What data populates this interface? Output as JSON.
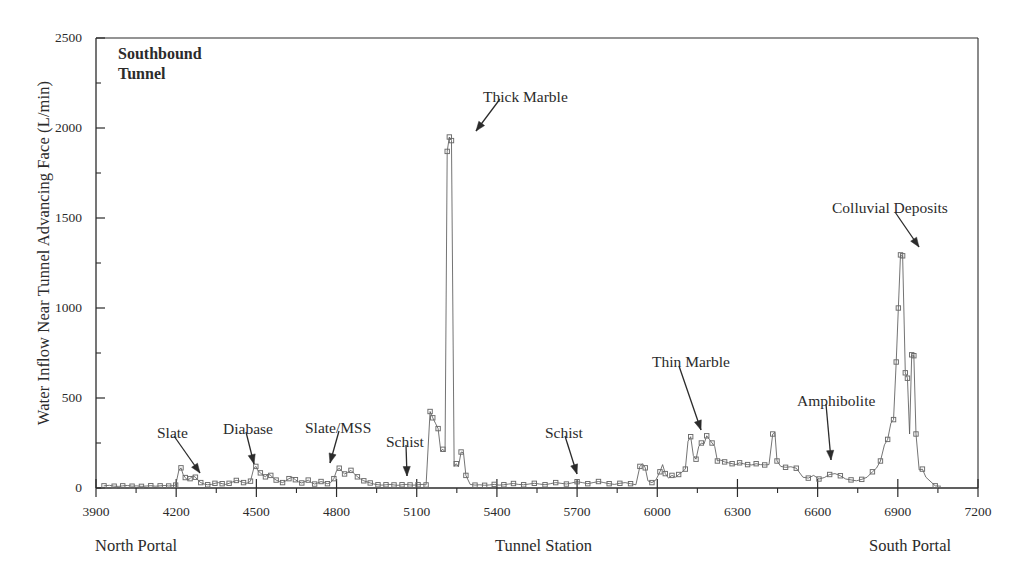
{
  "figure": {
    "panel_title": "Southbound\nTunnel",
    "panel_title_line1": "Southbound",
    "panel_title_line2": "Tunnel",
    "line_color": "#5b5b5b",
    "marker_color": "#6a6a6a",
    "axis_color": "#2b2b2b",
    "background": "#ffffff"
  },
  "axes": {
    "x_title": "Tunnel Station",
    "x_left_caption": "North Portal",
    "x_right_caption": "South Portal",
    "y_title": "Water Inflow Near Tunnel Advancing Face (L/min)",
    "x_ticks": [
      3900,
      4200,
      4500,
      4800,
      5100,
      5400,
      5700,
      6000,
      6300,
      6600,
      6900,
      7200
    ],
    "y_ticks": [
      0,
      500,
      1000,
      1500,
      2000,
      2500
    ],
    "y_minor_ticks": [
      250,
      750,
      1250,
      1750,
      2250
    ],
    "xlim": [
      3900,
      7200
    ],
    "ylim": [
      0,
      2500
    ]
  },
  "annotations": [
    {
      "label": "Slate",
      "text_x": 157,
      "text_y": 424,
      "tip_x": 200,
      "tip_y": 473,
      "tail_x": 174,
      "tail_y": 436
    },
    {
      "label": "Diabase",
      "text_x": 223,
      "text_y": 420,
      "tip_x": 254,
      "tip_y": 464,
      "tail_x": 246,
      "tail_y": 432
    },
    {
      "label": "Slate/MSS",
      "text_x": 305,
      "text_y": 419,
      "tip_x": 330,
      "tip_y": 463,
      "tail_x": 339,
      "tail_y": 431
    },
    {
      "label": "Schist",
      "text_x": 386,
      "text_y": 433,
      "tip_x": 407,
      "tip_y": 476,
      "tail_x": 406,
      "tail_y": 445
    },
    {
      "label": "Thick Marble",
      "text_x": 483,
      "text_y": 88,
      "tip_x": 476,
      "tip_y": 131,
      "tail_x": 500,
      "tail_y": 99
    },
    {
      "label": "Schist",
      "text_x": 545,
      "text_y": 424,
      "tip_x": 577,
      "tip_y": 474,
      "tail_x": 565,
      "tail_y": 436
    },
    {
      "label": "Thin Marble",
      "text_x": 652,
      "text_y": 353,
      "tip_x": 701,
      "tip_y": 430,
      "tail_x": 679,
      "tail_y": 366
    },
    {
      "label": "Amphibolite",
      "text_x": 797,
      "text_y": 392,
      "tip_x": 831,
      "tip_y": 460,
      "tail_x": 826,
      "tail_y": 404
    },
    {
      "label": "Colluvial Deposits",
      "text_x": 832,
      "text_y": 199,
      "tip_x": 919,
      "tip_y": 247,
      "tail_x": 895,
      "tail_y": 212
    }
  ],
  "chart_data": {
    "type": "line",
    "title": "Southbound Tunnel",
    "xlabel": "Tunnel Station",
    "ylabel": "Water Inflow Near Tunnel Advancing Face (L/min)",
    "xlim": [
      3900,
      7200
    ],
    "ylim": [
      0,
      2500
    ],
    "grid": false,
    "legend": "none",
    "marker": "open-square",
    "series": [
      {
        "name": "Water inflow near tunnel advancing face",
        "points": [
          [
            3930,
            12
          ],
          [
            3950,
            15
          ],
          [
            3968,
            10
          ],
          [
            3985,
            9
          ],
          [
            4000,
            12
          ],
          [
            4018,
            14
          ],
          [
            4035,
            10
          ],
          [
            4052,
            12
          ],
          [
            4070,
            9
          ],
          [
            4088,
            11
          ],
          [
            4105,
            13
          ],
          [
            4122,
            10
          ],
          [
            4140,
            12
          ],
          [
            4158,
            14
          ],
          [
            4172,
            11
          ],
          [
            4185,
            13
          ],
          [
            4198,
            16
          ],
          [
            4210,
            98
          ],
          [
            4218,
            112
          ],
          [
            4226,
            75
          ],
          [
            4234,
            58
          ],
          [
            4242,
            45
          ],
          [
            4252,
            52
          ],
          [
            4262,
            68
          ],
          [
            4272,
            60
          ],
          [
            4282,
            42
          ],
          [
            4292,
            30
          ],
          [
            4305,
            22
          ],
          [
            4318,
            18
          ],
          [
            4332,
            20
          ],
          [
            4345,
            26
          ],
          [
            4358,
            30
          ],
          [
            4372,
            24
          ],
          [
            4385,
            20
          ],
          [
            4398,
            26
          ],
          [
            4412,
            34
          ],
          [
            4425,
            42
          ],
          [
            4438,
            38
          ],
          [
            4452,
            30
          ],
          [
            4465,
            26
          ],
          [
            4478,
            38
          ],
          [
            4490,
            108
          ],
          [
            4498,
            120
          ],
          [
            4506,
            96
          ],
          [
            4515,
            84
          ],
          [
            4524,
            72
          ],
          [
            4534,
            62
          ],
          [
            4544,
            78
          ],
          [
            4554,
            70
          ],
          [
            4564,
            54
          ],
          [
            4574,
            44
          ],
          [
            4586,
            36
          ],
          [
            4598,
            30
          ],
          [
            4610,
            40
          ],
          [
            4622,
            52
          ],
          [
            4634,
            60
          ],
          [
            4646,
            46
          ],
          [
            4658,
            34
          ],
          [
            4670,
            28
          ],
          [
            4682,
            36
          ],
          [
            4694,
            44
          ],
          [
            4706,
            30
          ],
          [
            4718,
            22
          ],
          [
            4730,
            28
          ],
          [
            4742,
            36
          ],
          [
            4754,
            30
          ],
          [
            4766,
            24
          ],
          [
            4778,
            30
          ],
          [
            4790,
            52
          ],
          [
            4800,
            96
          ],
          [
            4810,
            110
          ],
          [
            4820,
            92
          ],
          [
            4830,
            78
          ],
          [
            4842,
            86
          ],
          [
            4854,
            98
          ],
          [
            4866,
            80
          ],
          [
            4878,
            62
          ],
          [
            4890,
            50
          ],
          [
            4902,
            40
          ],
          [
            4914,
            34
          ],
          [
            4926,
            28
          ],
          [
            4940,
            22
          ],
          [
            4955,
            18
          ],
          [
            4970,
            16
          ],
          [
            4985,
            18
          ],
          [
            5000,
            20
          ],
          [
            5015,
            17
          ],
          [
            5030,
            15
          ],
          [
            5045,
            18
          ],
          [
            5060,
            20
          ],
          [
            5075,
            17
          ],
          [
            5090,
            16
          ],
          [
            5105,
            18
          ],
          [
            5120,
            20
          ],
          [
            5135,
            17
          ],
          [
            5150,
            425
          ],
          [
            5160,
            390
          ],
          [
            5170,
            360
          ],
          [
            5180,
            330
          ],
          [
            5190,
            205
          ],
          [
            5198,
            215
          ],
          [
            5206,
            200
          ],
          [
            5214,
            1870
          ],
          [
            5222,
            1950
          ],
          [
            5230,
            1930
          ],
          [
            5240,
            120
          ],
          [
            5248,
            135
          ],
          [
            5256,
            118
          ],
          [
            5266,
            200
          ],
          [
            5275,
            195
          ],
          [
            5284,
            70
          ],
          [
            5300,
            20
          ],
          [
            5318,
            16
          ],
          [
            5336,
            18
          ],
          [
            5354,
            15
          ],
          [
            5372,
            17
          ],
          [
            5390,
            20
          ],
          [
            5408,
            16
          ],
          [
            5426,
            18
          ],
          [
            5444,
            22
          ],
          [
            5462,
            25
          ],
          [
            5480,
            20
          ],
          [
            5500,
            18
          ],
          [
            5520,
            22
          ],
          [
            5540,
            26
          ],
          [
            5560,
            22
          ],
          [
            5580,
            18
          ],
          [
            5600,
            24
          ],
          [
            5620,
            30
          ],
          [
            5640,
            26
          ],
          [
            5660,
            22
          ],
          [
            5680,
            28
          ],
          [
            5700,
            35
          ],
          [
            5720,
            30
          ],
          [
            5740,
            24
          ],
          [
            5760,
            30
          ],
          [
            5780,
            36
          ],
          [
            5800,
            30
          ],
          [
            5820,
            24
          ],
          [
            5840,
            20
          ],
          [
            5860,
            26
          ],
          [
            5880,
            30
          ],
          [
            5900,
            24
          ],
          [
            5920,
            18
          ],
          [
            5935,
            120
          ],
          [
            5945,
            135
          ],
          [
            5955,
            112
          ],
          [
            5965,
            40
          ],
          [
            5980,
            30
          ],
          [
            5995,
            45
          ],
          [
            6010,
            90
          ],
          [
            6020,
            130
          ],
          [
            6030,
            80
          ],
          [
            6042,
            55
          ],
          [
            6055,
            70
          ],
          [
            6068,
            60
          ],
          [
            6080,
            75
          ],
          [
            6092,
            88
          ],
          [
            6105,
            105
          ],
          [
            6115,
            260
          ],
          [
            6125,
            285
          ],
          [
            6135,
            180
          ],
          [
            6145,
            160
          ],
          [
            6155,
            230
          ],
          [
            6165,
            250
          ],
          [
            6175,
            245
          ],
          [
            6185,
            290
          ],
          [
            6195,
            270
          ],
          [
            6205,
            250
          ],
          [
            6215,
            230
          ],
          [
            6225,
            150
          ],
          [
            6238,
            155
          ],
          [
            6252,
            145
          ],
          [
            6266,
            140
          ],
          [
            6280,
            135
          ],
          [
            6294,
            130
          ],
          [
            6308,
            140
          ],
          [
            6322,
            135
          ],
          [
            6338,
            130
          ],
          [
            6354,
            128
          ],
          [
            6370,
            135
          ],
          [
            6386,
            130
          ],
          [
            6402,
            128
          ],
          [
            6418,
            130
          ],
          [
            6432,
            300
          ],
          [
            6440,
            310
          ],
          [
            6448,
            150
          ],
          [
            6462,
            120
          ],
          [
            6480,
            115
          ],
          [
            6500,
            118
          ],
          [
            6520,
            110
          ],
          [
            6545,
            60
          ],
          [
            6565,
            55
          ],
          [
            6585,
            70
          ],
          [
            6605,
            50
          ],
          [
            6625,
            58
          ],
          [
            6645,
            75
          ],
          [
            6665,
            80
          ],
          [
            6685,
            68
          ],
          [
            6705,
            50
          ],
          [
            6725,
            45
          ],
          [
            6745,
            40
          ],
          [
            6765,
            48
          ],
          [
            6785,
            60
          ],
          [
            6805,
            90
          ],
          [
            6820,
            110
          ],
          [
            6835,
            150
          ],
          [
            6850,
            240
          ],
          [
            6862,
            270
          ],
          [
            6874,
            360
          ],
          [
            6884,
            380
          ],
          [
            6894,
            700
          ],
          [
            6902,
            1000
          ],
          [
            6910,
            1295
          ],
          [
            6918,
            1290
          ],
          [
            6928,
            640
          ],
          [
            6936,
            610
          ],
          [
            6944,
            300
          ],
          [
            6952,
            740
          ],
          [
            6960,
            735
          ],
          [
            6968,
            300
          ],
          [
            6980,
            100
          ],
          [
            6992,
            105
          ],
          [
            7005,
            60
          ],
          [
            7040,
            12
          ],
          [
            7060,
            10
          ]
        ]
      }
    ]
  }
}
